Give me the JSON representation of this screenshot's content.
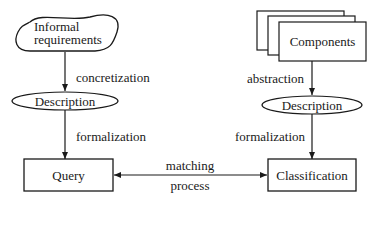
{
  "diagram": {
    "left": {
      "source": "Informal requirements",
      "source_line1": "Informal",
      "source_line2": "requirements",
      "edge1": "concretization",
      "middle": "Description",
      "edge2": "formalization",
      "target": "Query"
    },
    "right": {
      "source": "Components",
      "edge1": "abstraction",
      "middle": "Description",
      "edge2": "formalization",
      "target": "Classification"
    },
    "link": {
      "line1": "matching",
      "line2": "process"
    }
  }
}
